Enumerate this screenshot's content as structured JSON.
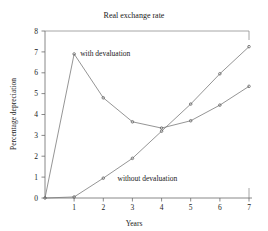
{
  "chart_data": {
    "type": "line",
    "title": "Real exchange rate",
    "xlabel": "Years",
    "ylabel": "Percentage depreciation",
    "xlim": [
      0,
      7
    ],
    "ylim": [
      0,
      8
    ],
    "xticks": [
      "1",
      "2",
      "3",
      "4",
      "5",
      "6",
      "7"
    ],
    "xtick_values": [
      1,
      2,
      3,
      4,
      5,
      6,
      7
    ],
    "yticks": [
      "0",
      "1",
      "2",
      "3",
      "4",
      "5",
      "6",
      "7",
      "8"
    ],
    "ytick_values": [
      0,
      1,
      2,
      3,
      4,
      5,
      6,
      7,
      8
    ],
    "grid": false,
    "legend_position": "inline-annotations",
    "x": [
      0,
      1,
      2,
      3,
      4,
      5,
      6,
      7
    ],
    "series": [
      {
        "name": "with devaluation",
        "label": "with devaluation",
        "values": [
          0,
          6.9,
          4.8,
          3.65,
          3.35,
          3.7,
          4.45,
          5.35
        ],
        "color": "#7a7a7a",
        "marker": "point",
        "annotation": {
          "text": "with devaluation",
          "x": 1.0,
          "y": 6.95
        }
      },
      {
        "name": "without devaluation",
        "label": "without devaluation",
        "values": [
          0,
          0.05,
          0.95,
          1.9,
          3.2,
          4.5,
          5.95,
          7.25
        ],
        "color": "#7a7a7a",
        "marker": "point",
        "annotation": {
          "text": "without devaluation",
          "x": 2.35,
          "y": 0.95
        }
      }
    ]
  }
}
